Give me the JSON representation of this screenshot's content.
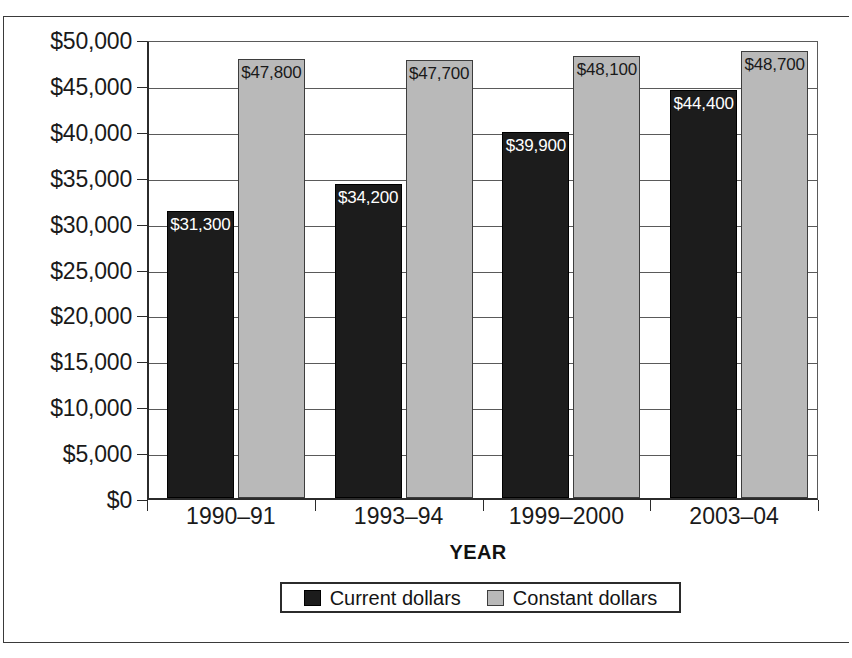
{
  "chart_data": {
    "type": "bar",
    "title": "",
    "xlabel": "YEAR",
    "ylabel": "",
    "categories": [
      "1990–91",
      "1993–94",
      "1999–2000",
      "2003–04"
    ],
    "series": [
      {
        "name": "Current dollars",
        "color": "#1c1c1c",
        "values": [
          31300,
          34200,
          39900,
          44400
        ],
        "labels": [
          "$31,300",
          "$34,200",
          "$39,900",
          "$44,400"
        ]
      },
      {
        "name": "Constant dollars",
        "color": "#b9b9b9",
        "values": [
          47800,
          47700,
          48100,
          48700
        ],
        "labels": [
          "$47,800",
          "$47,700",
          "$48,100",
          "$48,700"
        ]
      }
    ],
    "ylim": [
      0,
      50000
    ],
    "ytick_values": [
      0,
      5000,
      10000,
      15000,
      20000,
      25000,
      30000,
      35000,
      40000,
      45000,
      50000
    ],
    "ytick_labels": [
      "$0",
      "$5,000",
      "$10,000",
      "$15,000",
      "$20,000",
      "$25,000",
      "$30,000",
      "$35,000",
      "$40,000",
      "$45,000",
      "$50,000"
    ],
    "grid": true,
    "legend_position": "bottom"
  },
  "axis": {
    "x_title": "YEAR"
  },
  "legend": {
    "items": [
      {
        "label": "Current dollars",
        "swatch": "dark-swatch"
      },
      {
        "label": "Constant dollars",
        "swatch": "light-swatch"
      }
    ]
  },
  "ylabels": [
    {
      "text": "$50,000",
      "value": 50000
    },
    {
      "text": "$45,000",
      "value": 45000
    },
    {
      "text": "$40,000",
      "value": 40000
    },
    {
      "text": "$35,000",
      "value": 35000
    },
    {
      "text": "$30,000",
      "value": 30000
    },
    {
      "text": "$25,000",
      "value": 25000
    },
    {
      "text": "$20,000",
      "value": 20000
    },
    {
      "text": "$15,000",
      "value": 15000
    },
    {
      "text": "$10,000",
      "value": 10000
    },
    {
      "text": "$5,000",
      "value": 5000
    },
    {
      "text": "$0",
      "value": 0
    }
  ]
}
